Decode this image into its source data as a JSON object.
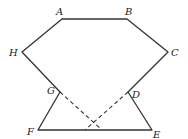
{
  "diagram": {
    "stroke_color": "#333333",
    "points": {
      "A": {
        "label": "A",
        "x": 62,
        "y": 19
      },
      "B": {
        "label": "B",
        "x": 127,
        "y": 19
      },
      "C": {
        "label": "C",
        "x": 168,
        "y": 52
      },
      "D": {
        "label": "D",
        "x": 128,
        "y": 92
      },
      "E": {
        "label": "E",
        "x": 152,
        "y": 130
      },
      "F": {
        "label": "F",
        "x": 38,
        "y": 130
      },
      "G": {
        "label": "G",
        "x": 60,
        "y": 92
      },
      "H": {
        "label": "H",
        "x": 22,
        "y": 52
      }
    },
    "solid_segments": [
      "AB",
      "BC",
      "CD",
      "DE",
      "EF",
      "FG",
      "GH",
      "HA"
    ],
    "dashed_segments": [
      {
        "from": "G",
        "to_x": 102,
        "to_y": 130
      },
      {
        "from": "D",
        "to_x": 85,
        "to_y": 130
      }
    ]
  }
}
